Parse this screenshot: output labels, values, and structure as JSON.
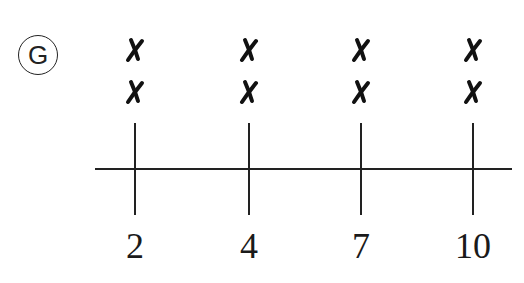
{
  "option_label": "G",
  "chart_data": {
    "type": "dot_plot",
    "title": "",
    "xlabel": "",
    "ylabel": "",
    "categories": [
      "2",
      "4",
      "7",
      "10"
    ],
    "values": [
      2,
      2,
      2,
      2
    ],
    "marker": "X",
    "grid": false
  },
  "axis": {
    "tick_labels": [
      "2",
      "4",
      "7",
      "10"
    ]
  },
  "colors": {
    "ink": "#222222",
    "background": "#ffffff"
  }
}
